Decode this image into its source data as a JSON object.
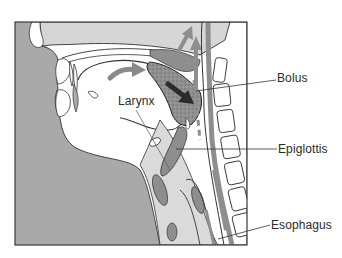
{
  "diagram": {
    "type": "anatomical cross-section",
    "labels": {
      "bolus": "Bolus",
      "larynx": "Larynx",
      "epiglottis": "Epiglottis",
      "esophagus": "Esophagus"
    },
    "colors": {
      "background_gray": "#a9a9a9",
      "tissue_light": "#d4d4d4",
      "tissue_mid": "#8e8e8e",
      "bolus_fill": "#8a8a8a",
      "arrow_dark": "#2b2b2b",
      "outline": "#333333",
      "white": "#ffffff"
    }
  }
}
